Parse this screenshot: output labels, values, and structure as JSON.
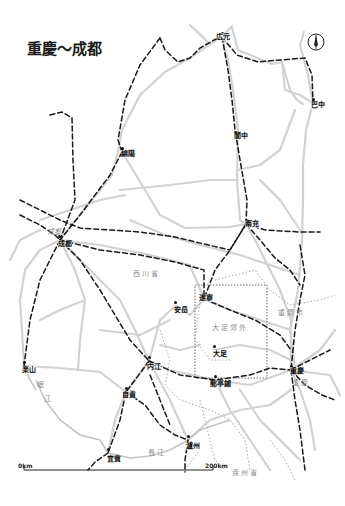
{
  "title": "重慶〜成都",
  "compass": {
    "icon": "north-arrow-icon"
  },
  "cities": [
    {
      "id": "guangyuan",
      "label": "広元",
      "x": 222,
      "y": 37,
      "dx": 216,
      "dy": 33
    },
    {
      "id": "bazhong",
      "label": "巴中",
      "x": 313,
      "y": 103,
      "dx": 311,
      "dy": 101
    },
    {
      "id": "mianyang",
      "label": "綿陽",
      "x": 122,
      "y": 152,
      "dx": 121,
      "dy": 150
    },
    {
      "id": "langzhong",
      "label": "閬中",
      "x": 235,
      "y": 136,
      "dx": 234,
      "dy": 132
    },
    {
      "id": "nanchong",
      "label": "南充",
      "x": 246,
      "y": 224,
      "dx": 245,
      "dy": 220
    },
    {
      "id": "chengdu",
      "label": "成都",
      "x": 59,
      "y": 240,
      "dx": 58,
      "dy": 240
    },
    {
      "id": "suining",
      "label": "遂寧",
      "x": 204,
      "y": 299,
      "dx": 199,
      "dy": 294
    },
    {
      "id": "anyue",
      "label": "安岳",
      "x": 175,
      "y": 306,
      "dx": 174,
      "dy": 306
    },
    {
      "id": "dazu",
      "label": "大足",
      "x": 214,
      "y": 350,
      "dx": 213,
      "dy": 350
    },
    {
      "id": "leshan",
      "label": "楽山",
      "x": 24,
      "y": 366,
      "dx": 22,
      "dy": 366
    },
    {
      "id": "neijiang",
      "label": "内江",
      "x": 149,
      "y": 361,
      "dx": 147,
      "dy": 363
    },
    {
      "id": "chongqing",
      "label": "重慶",
      "x": 291,
      "y": 370,
      "dx": 290,
      "dy": 367
    },
    {
      "id": "youtingpu",
      "label": "郵亭鋪",
      "x": 215,
      "y": 380,
      "dx": 210,
      "dy": 380
    },
    {
      "id": "zigong",
      "label": "自貢",
      "x": 126,
      "y": 392,
      "dx": 122,
      "dy": 391
    },
    {
      "id": "luzhou",
      "label": "瀘州",
      "x": 188,
      "y": 440,
      "dx": 186,
      "dy": 442
    },
    {
      "id": "yibin",
      "label": "宜賓",
      "x": 108,
      "y": 453,
      "dx": 107,
      "dy": 455
    }
  ],
  "city_faded": [
    {
      "id": "chengdu-area",
      "label": "成都",
      "x": 48,
      "y": 228
    }
  ],
  "regions": [
    {
      "id": "sichuan",
      "label": "西川省",
      "x": 133,
      "y": 270
    },
    {
      "id": "chongqing-city",
      "label": "重慶市",
      "x": 278,
      "y": 309
    },
    {
      "id": "dazu-suburb",
      "label": "大足郊外",
      "x": 212,
      "y": 324
    },
    {
      "id": "chongqing-area",
      "label": "重慶",
      "x": 292,
      "y": 379
    },
    {
      "id": "guizhou",
      "label": "貴州省",
      "x": 232,
      "y": 469
    },
    {
      "id": "changjiang",
      "label": "長江",
      "x": 148,
      "y": 449
    },
    {
      "id": "minjiang-1",
      "label": "岷",
      "x": 37,
      "y": 381
    },
    {
      "id": "minjiang-2",
      "label": "江",
      "x": 44,
      "y": 395
    }
  ],
  "scale_bar": {
    "start_label": "0km",
    "end_label": "200km",
    "x1": 24,
    "x2": 213,
    "y": 470
  },
  "colors": {
    "road": "#cfcfcf",
    "rail": "#1a1a1a",
    "border": "#a8a8a8",
    "text": "#111111",
    "region_text": "#8a8a8a"
  }
}
